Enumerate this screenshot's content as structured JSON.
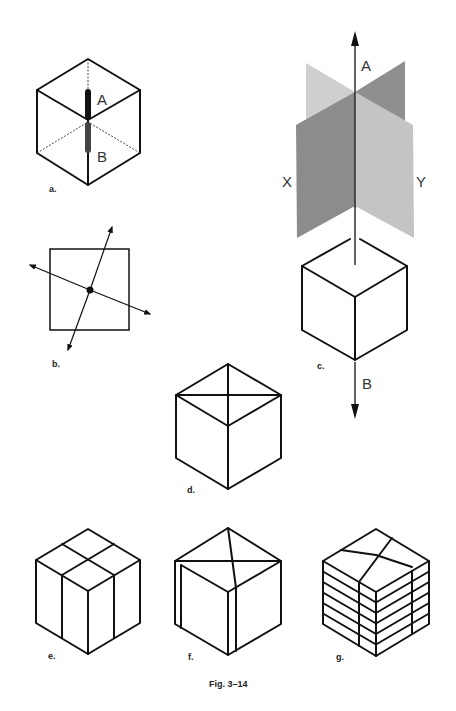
{
  "caption": "Fig. 3–14",
  "figures": {
    "a": {
      "label": "a.",
      "axis_labels": {
        "top": "A",
        "bottom": "B"
      }
    },
    "b": {
      "label": "b."
    },
    "c": {
      "label": "c.",
      "axis_labels": {
        "top": "A",
        "bottom": "B",
        "left_plane": "X",
        "right_plane": "Y"
      }
    },
    "d": {
      "label": "d."
    },
    "e": {
      "label": "e."
    },
    "f": {
      "label": "f."
    },
    "g": {
      "label": "g."
    }
  },
  "colors": {
    "line": "#111111",
    "plane_dark": "#8c8c8c",
    "plane_light": "#c4c4c4",
    "plane_back_light": "#cfcfcf",
    "plane_back_dark": "#8f8f8f"
  }
}
